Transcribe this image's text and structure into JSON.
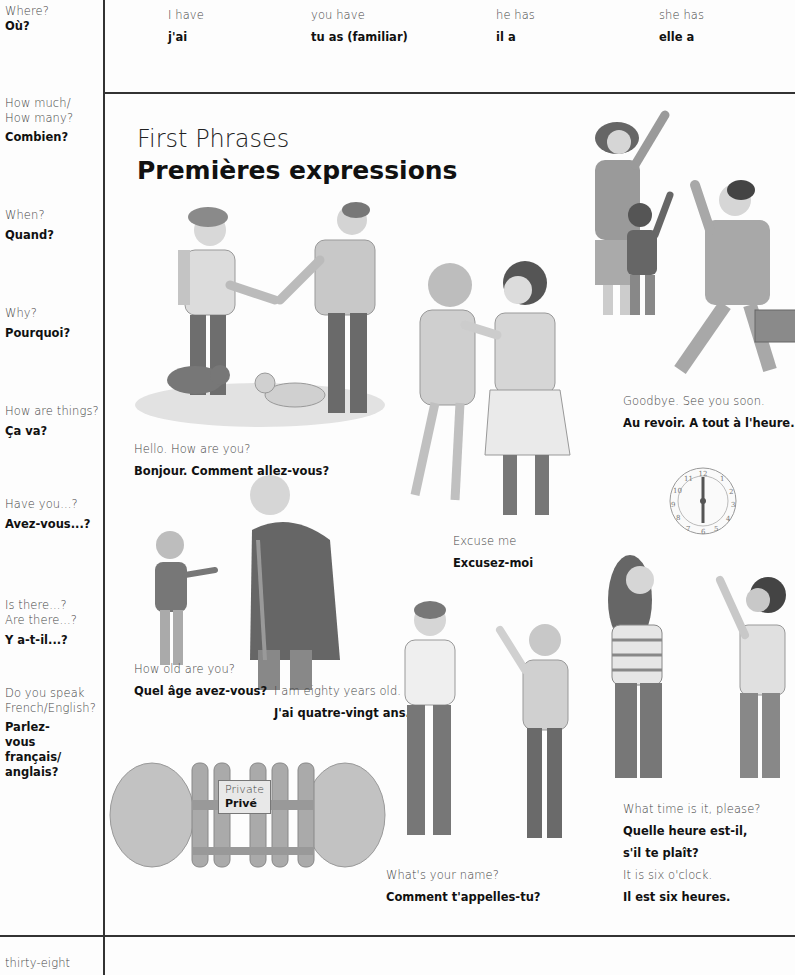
{
  "top_row": [
    {
      "en": "I have",
      "fr": "j'ai"
    },
    {
      "en": "you have",
      "fr": "tu  as (familiar)"
    },
    {
      "en": "he has",
      "fr": "il a"
    },
    {
      "en": "she has",
      "fr": "elle a"
    }
  ],
  "sidebar": {
    "items": [
      {
        "en": "Where?",
        "fr": "Où?"
      },
      {
        "en": "How much/ How many?",
        "fr": "Combien?"
      },
      {
        "en": "When?",
        "fr": "Quand?"
      },
      {
        "en": "Why?",
        "fr": "Pourquoi?"
      },
      {
        "en": "How are things?",
        "fr": "Ça va?"
      },
      {
        "en": "Have you...?",
        "fr": "Avez-vous...?"
      },
      {
        "en": "Is there...? Are there...?",
        "fr": "Y a-t-il...?"
      },
      {
        "en": "Do you speak French/English?",
        "fr": "Parlez-vous français/ anglais?"
      }
    ],
    "page_number": "thirty-eight"
  },
  "main": {
    "title_en": "First Phrases",
    "title_fr": "Premières expressions",
    "phrases": [
      {
        "en": "Hello. How are you?",
        "fr": "Bonjour. Comment allez-vous?"
      },
      {
        "en": "Goodbye. See you soon.",
        "fr": "Au revoir. A tout à l'heure."
      },
      {
        "en": "Excuse me",
        "fr": "Excusez-moi"
      },
      {
        "en": "How old are you?",
        "fr": "Quel âge avez-vous?"
      },
      {
        "en": "I am eighty years old.",
        "fr": "J'ai quatre-vingt ans."
      },
      {
        "en": "What's your name?",
        "fr": "Comment t'appelles-tu?"
      },
      {
        "en": "What time is it, please?",
        "fr": "Quelle heure est-il,",
        "fr2": "s'il te plaît?"
      },
      {
        "en": "It is six o'clock.",
        "fr": "Il est six heures."
      }
    ],
    "sign": {
      "en": "Private",
      "fr": "Privé"
    },
    "clock": {
      "numbers": [
        "12",
        "1",
        "2",
        "3",
        "4",
        "5",
        "6",
        "7",
        "8",
        "9",
        "10",
        "11"
      ]
    }
  },
  "colors": {
    "rule": "#333333",
    "figure_dark": "#6e6e6e",
    "figure_mid": "#9a9a9a",
    "figure_light": "#c9c9c9",
    "hedge": "#b5b5b5"
  }
}
